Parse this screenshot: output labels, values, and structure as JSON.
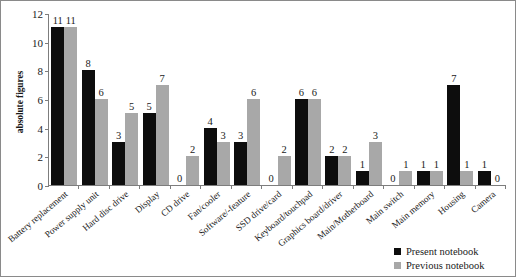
{
  "chart_data": {
    "type": "bar",
    "title": "",
    "xlabel": "",
    "ylabel": "absolute figures",
    "ylim": [
      0,
      12
    ],
    "yticks": [
      0,
      2,
      4,
      6,
      8,
      10,
      12
    ],
    "grid": false,
    "legend_position": "bottom-right",
    "categories": [
      "Battery replacement",
      "Power supply unit",
      "Hard disc drive",
      "Display",
      "CD drive",
      "Fan/cooler",
      "Software/-feature",
      "SSD drive/card",
      "Keyboard/touchpad",
      "Graphics board/driver",
      "Main/Motherboard",
      "Main switch",
      "Main memory",
      "Housing",
      "Camera"
    ],
    "series": [
      {
        "name": "Present notebook",
        "color": "#0d0d0d",
        "values": [
          11,
          8,
          3,
          5,
          0,
          4,
          3,
          0,
          6,
          2,
          1,
          0,
          1,
          7,
          1
        ]
      },
      {
        "name": "Previous notebook",
        "color": "#a8a8a8",
        "values": [
          11,
          6,
          5,
          7,
          2,
          3,
          6,
          2,
          6,
          2,
          3,
          1,
          1,
          1,
          0
        ]
      }
    ]
  },
  "legend": {
    "items": [
      {
        "label": "Present notebook",
        "color": "#0d0d0d"
      },
      {
        "label": "Previous notebook",
        "color": "#a8a8a8"
      }
    ]
  }
}
